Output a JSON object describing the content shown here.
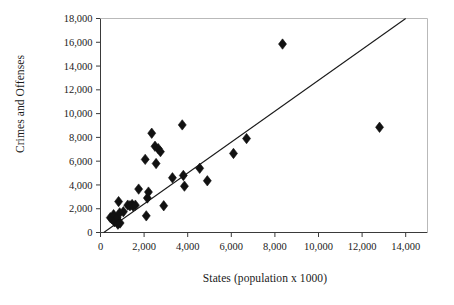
{
  "chart_data": {
    "type": "scatter",
    "title": "",
    "xlabel": "States (population x 1000)",
    "ylabel": "Crimes and Offenses",
    "xlim": [
      0,
      15000
    ],
    "ylim": [
      0,
      18000
    ],
    "xticks": [
      0,
      2000,
      4000,
      6000,
      8000,
      10000,
      12000,
      14000
    ],
    "xtick_labels": [
      "0",
      "2,000",
      "4,000",
      "6,000",
      "8,000",
      "10,000",
      "12,000",
      "14,000"
    ],
    "yticks": [
      0,
      2000,
      4000,
      6000,
      8000,
      10000,
      12000,
      14000,
      16000,
      18000
    ],
    "ytick_labels": [
      "0",
      "2,000",
      "4,000",
      "6,000",
      "8,000",
      "10,000",
      "12,000",
      "14,000",
      "16,000",
      "18,000"
    ],
    "grid": false,
    "legend": "none",
    "marker": "diamond",
    "marker_color": "#111111",
    "line_color": "#1a1a1a",
    "points": [
      {
        "x": 450,
        "y": 1250
      },
      {
        "x": 520,
        "y": 1150
      },
      {
        "x": 600,
        "y": 1500
      },
      {
        "x": 640,
        "y": 900
      },
      {
        "x": 700,
        "y": 1000
      },
      {
        "x": 760,
        "y": 1250
      },
      {
        "x": 800,
        "y": 700
      },
      {
        "x": 830,
        "y": 2600
      },
      {
        "x": 880,
        "y": 1650
      },
      {
        "x": 900,
        "y": 800
      },
      {
        "x": 1050,
        "y": 1750
      },
      {
        "x": 1250,
        "y": 2300
      },
      {
        "x": 1350,
        "y": 2250
      },
      {
        "x": 1450,
        "y": 2350
      },
      {
        "x": 1500,
        "y": 2200
      },
      {
        "x": 1600,
        "y": 2300
      },
      {
        "x": 1750,
        "y": 3650
      },
      {
        "x": 2050,
        "y": 6150
      },
      {
        "x": 2100,
        "y": 1400
      },
      {
        "x": 2150,
        "y": 2900
      },
      {
        "x": 2200,
        "y": 3400
      },
      {
        "x": 2350,
        "y": 8350
      },
      {
        "x": 2500,
        "y": 7250
      },
      {
        "x": 2550,
        "y": 5800
      },
      {
        "x": 2650,
        "y": 7050
      },
      {
        "x": 2750,
        "y": 6800
      },
      {
        "x": 2900,
        "y": 2250
      },
      {
        "x": 3300,
        "y": 4600
      },
      {
        "x": 3750,
        "y": 9050
      },
      {
        "x": 3800,
        "y": 4800
      },
      {
        "x": 3850,
        "y": 3900
      },
      {
        "x": 4550,
        "y": 5400
      },
      {
        "x": 4900,
        "y": 4350
      },
      {
        "x": 6100,
        "y": 6650
      },
      {
        "x": 6700,
        "y": 7900
      },
      {
        "x": 8350,
        "y": 15850
      },
      {
        "x": 12800,
        "y": 8850
      }
    ],
    "trend_line": {
      "x1": 150,
      "y1": 0,
      "x2": 14000,
      "y2": 18000
    }
  },
  "axis_titles": {
    "y": "Crimes and Offenses",
    "x": "States (population x 1000)"
  }
}
